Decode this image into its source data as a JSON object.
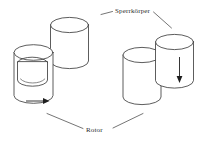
{
  "figure": {
    "type": "technical-line-drawing",
    "background_color": "#ffffff",
    "line_color": "#333333",
    "text_color": "#2b2b2b",
    "width": 217,
    "height": 146
  },
  "labels": {
    "sperrkoerper": "Sperrkörper",
    "rotor": "Rotor"
  },
  "annotations": {
    "left_arrow_name": "horizontal-motion-arrow",
    "right_arrow_name": "downward-motion-arrow"
  },
  "parts": {
    "left_group": {
      "rotor_name": "left-rotor-cylinder",
      "cavity_name": "left-rotor-cavity",
      "sperrkoerper_name": "left-sperrkoerper-cylinder"
    },
    "right_group": {
      "rotor_name": "right-rotor-cylinder",
      "sperrkoerper_name": "right-sperrkoerper-cylinder"
    }
  }
}
